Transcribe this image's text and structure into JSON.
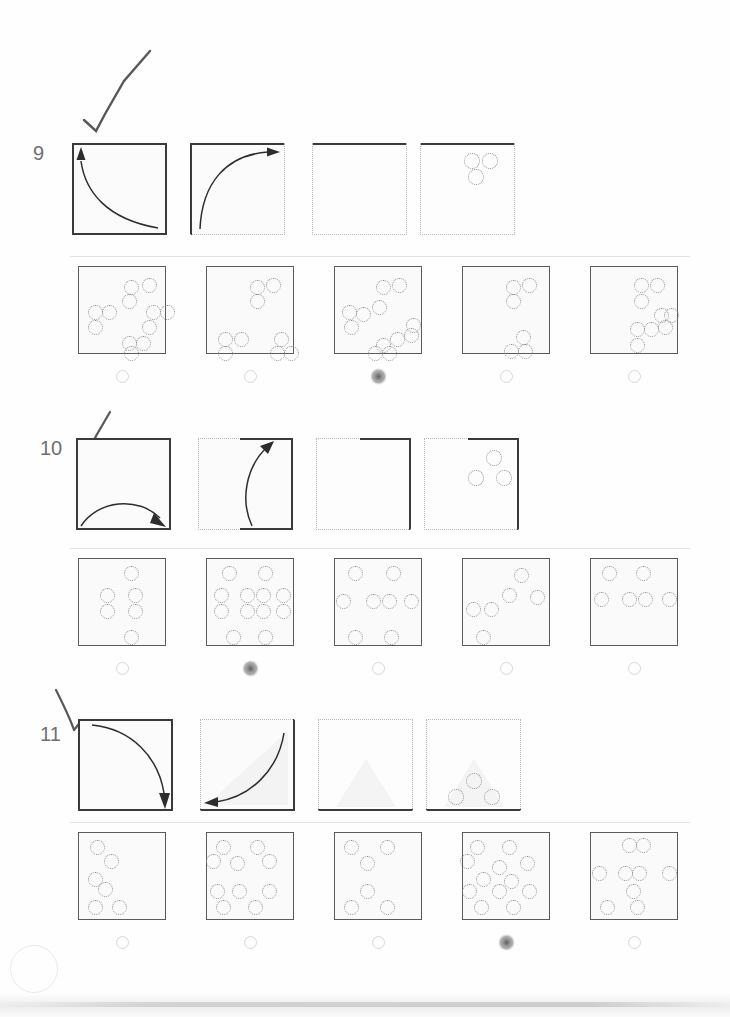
{
  "page": {
    "type": "scanned-worksheet",
    "background_color": "#fefefe",
    "ink_color": "#3a3a3a",
    "dotted_color": "#b9b9b9",
    "bubble_color": "#d8d8d8"
  },
  "questions": [
    {
      "number": "9",
      "hand_mark": "checkmark",
      "stimulus": [
        {
          "index": 1,
          "solid_edges": "top bottom left right",
          "shape": "fold-arrow-left-up-concave",
          "holes": []
        },
        {
          "index": 2,
          "solid_edges": "top left",
          "shape": "fold-arrow-up-right-convex",
          "holes": []
        },
        {
          "index": 3,
          "solid_edges": "top",
          "shape": "none",
          "holes": []
        },
        {
          "index": 4,
          "solid_edges": "top",
          "shape": "none",
          "holes": [
            {
              "cx": 52,
              "cy": 18,
              "r": 8
            },
            {
              "cx": 70,
              "cy": 18,
              "r": 8
            },
            {
              "cx": 56,
              "cy": 34,
              "r": 8
            }
          ]
        }
      ],
      "options": [
        {
          "letter": "A",
          "marked": false,
          "holes": [
            [
              52,
              20
            ],
            [
              70,
              18
            ],
            [
              50,
              34
            ],
            [
              16,
              45
            ],
            [
              30,
              45
            ],
            [
              74,
              45
            ],
            [
              88,
              45
            ],
            [
              16,
              60
            ],
            [
              70,
              60
            ],
            [
              50,
              76
            ],
            [
              64,
              76
            ],
            [
              52,
              86
            ]
          ]
        },
        {
          "letter": "B",
          "marked": false,
          "holes": [
            [
              50,
              20
            ],
            [
              66,
              18
            ],
            [
              50,
              34
            ],
            [
              18,
              72
            ],
            [
              34,
              72
            ],
            [
              18,
              86
            ],
            [
              70,
              86
            ],
            [
              74,
              72
            ],
            [
              84,
              86
            ]
          ]
        },
        {
          "letter": "C",
          "marked": true,
          "holes": [
            [
              48,
              20
            ],
            [
              64,
              18
            ],
            [
              14,
              45
            ],
            [
              28,
              47
            ],
            [
              44,
              40
            ],
            [
              16,
              60
            ],
            [
              78,
              58
            ],
            [
              62,
              72
            ],
            [
              76,
              68
            ],
            [
              48,
              78
            ],
            [
              40,
              86
            ],
            [
              54,
              86
            ]
          ]
        },
        {
          "letter": "D",
          "marked": false,
          "holes": [
            [
              50,
              20
            ],
            [
              66,
              18
            ],
            [
              50,
              34
            ],
            [
              60,
              70
            ],
            [
              48,
              84
            ],
            [
              62,
              84
            ]
          ]
        },
        {
          "letter": "E",
          "marked": false,
          "holes": [
            [
              50,
              18
            ],
            [
              66,
              18
            ],
            [
              50,
              34
            ],
            [
              70,
              48
            ],
            [
              80,
              48
            ],
            [
              74,
              60
            ],
            [
              46,
              62
            ],
            [
              60,
              62
            ],
            [
              46,
              78
            ]
          ]
        }
      ]
    },
    {
      "number": "10",
      "hand_mark": "checkmark",
      "stimulus": [
        {
          "index": 1,
          "solid_edges": "top bottom left right",
          "shape": "fold-arrow-bottom-arc-right",
          "holes": []
        },
        {
          "index": 2,
          "solid_edges": "top right bottom-right",
          "shape": "fold-arrow-bottom-up",
          "holes": []
        },
        {
          "index": 3,
          "solid_edges": "right top-right",
          "shape": "none",
          "holes": []
        },
        {
          "index": 4,
          "solid_edges": "right top-right",
          "shape": "none",
          "holes": [
            {
              "cx": 70,
              "cy": 20,
              "r": 8
            },
            {
              "cx": 52,
              "cy": 40,
              "r": 8
            },
            {
              "cx": 80,
              "cy": 40,
              "r": 8
            }
          ]
        }
      ],
      "options": [
        {
          "letter": "A",
          "marked": false,
          "holes": [
            [
              52,
              14
            ],
            [
              28,
              36
            ],
            [
              28,
              52
            ],
            [
              56,
              36
            ],
            [
              56,
              52
            ],
            [
              52,
              78
            ]
          ]
        },
        {
          "letter": "B",
          "marked": true,
          "holes": [
            [
              22,
              14
            ],
            [
              58,
              14
            ],
            [
              14,
              36
            ],
            [
              14,
              52
            ],
            [
              40,
              36
            ],
            [
              56,
              36
            ],
            [
              40,
              52
            ],
            [
              56,
              52
            ],
            [
              76,
              36
            ],
            [
              76,
              52
            ],
            [
              26,
              78
            ],
            [
              58,
              78
            ]
          ]
        },
        {
          "letter": "C",
          "marked": false,
          "holes": [
            [
              20,
              14
            ],
            [
              58,
              14
            ],
            [
              8,
              42
            ],
            [
              38,
              42
            ],
            [
              54,
              42
            ],
            [
              76,
              42
            ],
            [
              20,
              78
            ],
            [
              56,
              78
            ]
          ]
        },
        {
          "letter": "D",
          "marked": false,
          "holes": [
            [
              58,
              16
            ],
            [
              46,
              36
            ],
            [
              74,
              38
            ],
            [
              10,
              50
            ],
            [
              28,
              50
            ],
            [
              20,
              78
            ]
          ]
        },
        {
          "letter": "E",
          "marked": false,
          "holes": [
            [
              18,
              14
            ],
            [
              52,
              14
            ],
            [
              10,
              40
            ],
            [
              38,
              40
            ],
            [
              54,
              40
            ],
            [
              78,
              40
            ]
          ]
        }
      ]
    },
    {
      "number": "11",
      "hand_mark": "checkmark",
      "stimulus": [
        {
          "index": 1,
          "solid_edges": "top bottom left right",
          "shape": "fold-arrow-top-down-right",
          "holes": []
        },
        {
          "index": 2,
          "solid_edges": "right bottom",
          "shape": "fold-arrow-right-to-left",
          "holes": []
        },
        {
          "index": 3,
          "solid_edges": "bottom",
          "shape": "triangle-shade",
          "holes": []
        },
        {
          "index": 4,
          "solid_edges": "bottom",
          "shape": "triangle-shade",
          "holes": [
            {
              "cx": 48,
              "cy": 62,
              "r": 8
            },
            {
              "cx": 30,
              "cy": 78,
              "r": 8
            },
            {
              "cx": 66,
              "cy": 78,
              "r": 8
            }
          ]
        }
      ],
      "options": [
        {
          "letter": "A",
          "marked": false,
          "holes": [
            [
              18,
              14
            ],
            [
              32,
              28
            ],
            [
              16,
              46
            ],
            [
              26,
              56
            ],
            [
              16,
              74
            ],
            [
              40,
              74
            ]
          ]
        },
        {
          "letter": "B",
          "marked": false,
          "holes": [
            [
              16,
              14
            ],
            [
              50,
              14
            ],
            [
              6,
              28
            ],
            [
              30,
              30
            ],
            [
              62,
              28
            ],
            [
              10,
              58
            ],
            [
              32,
              58
            ],
            [
              62,
              58
            ],
            [
              16,
              74
            ],
            [
              48,
              74
            ]
          ]
        },
        {
          "letter": "C",
          "marked": false,
          "holes": [
            [
              16,
              14
            ],
            [
              52,
              14
            ],
            [
              32,
              30
            ],
            [
              32,
              58
            ],
            [
              16,
              74
            ],
            [
              52,
              74
            ]
          ]
        },
        {
          "letter": "D",
          "marked": true,
          "holes": [
            [
              14,
              14
            ],
            [
              46,
              14
            ],
            [
              4,
              28
            ],
            [
              36,
              34
            ],
            [
              64,
              30
            ],
            [
              20,
              46
            ],
            [
              48,
              48
            ],
            [
              6,
              58
            ],
            [
              36,
              58
            ],
            [
              66,
              58
            ],
            [
              18,
              74
            ],
            [
              50,
              74
            ]
          ]
        },
        {
          "letter": "E",
          "marked": false,
          "holes": [
            [
              38,
              12
            ],
            [
              52,
              12
            ],
            [
              8,
              40
            ],
            [
              34,
              40
            ],
            [
              48,
              40
            ],
            [
              78,
              40
            ],
            [
              42,
              58
            ],
            [
              16,
              74
            ],
            [
              46,
              74
            ]
          ]
        }
      ]
    }
  ]
}
